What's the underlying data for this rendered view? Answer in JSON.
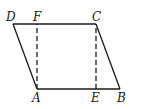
{
  "figure": {
    "type": "parallelogram-with-altitudes",
    "points": {
      "D": {
        "label": "D",
        "x": 13,
        "y": 24,
        "lx": 6,
        "ly": 21
      },
      "F": {
        "label": "F",
        "x": 37,
        "y": 24,
        "lx": 33,
        "ly": 21
      },
      "C": {
        "label": "C",
        "x": 96,
        "y": 24,
        "lx": 92,
        "ly": 21
      },
      "A": {
        "label": "A",
        "x": 37,
        "y": 89,
        "lx": 32,
        "ly": 102
      },
      "E": {
        "label": "E",
        "x": 96,
        "y": 89,
        "lx": 91,
        "ly": 102
      },
      "B": {
        "label": "B",
        "x": 120,
        "y": 89,
        "lx": 117,
        "ly": 102
      }
    },
    "solid_segments": [
      [
        "D",
        "C"
      ],
      [
        "C",
        "B"
      ],
      [
        "B",
        "A"
      ],
      [
        "A",
        "D"
      ]
    ],
    "dashed_segments": [
      [
        "A",
        "F"
      ],
      [
        "E",
        "C"
      ]
    ],
    "stroke_color": "#1a1a1a",
    "background": "#ffffff"
  }
}
